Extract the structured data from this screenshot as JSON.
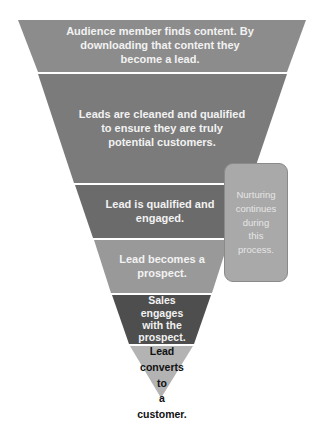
{
  "diagram": {
    "type": "funnel",
    "stages": [
      {
        "label": "Audience member finds content. By downloading that content they become a lead.",
        "lines": [
          "Audience member finds content. By",
          "downloading that content they",
          "become a lead."
        ],
        "color": "#8c8c8c"
      },
      {
        "label": "Leads are cleaned and qualified to ensure they are truly potential customers.",
        "lines": [
          "Leads are cleaned and qualified",
          "to ensure they are truly",
          "potential customers."
        ],
        "color": "#7b7b7b"
      },
      {
        "label": "Lead is qualified and engaged.",
        "lines": [
          "Lead is qualified and",
          "engaged."
        ],
        "color": "#6b6b6b"
      },
      {
        "label": "Lead becomes a prospect.",
        "lines": [
          "Lead becomes a",
          "prospect."
        ],
        "color": "#999999"
      },
      {
        "label": "Sales engages with the prospect.",
        "lines": [
          "Sales",
          "engages",
          "with the",
          "prospect."
        ],
        "color": "#4e4e4e"
      },
      {
        "label": "Lead converts to a customer.",
        "lines": [
          "Lead",
          "converts",
          "to",
          "a",
          "customer."
        ],
        "color": "#b3b3b3"
      }
    ],
    "note": {
      "label": "Nurturing continues during this process.",
      "lines": [
        "Nurturing",
        "continues",
        "during",
        "this",
        "process."
      ],
      "color": "#a9a9a9"
    },
    "separator_color": "#ffffff"
  }
}
